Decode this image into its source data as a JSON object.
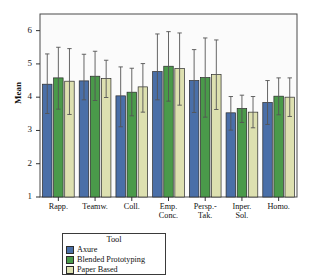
{
  "chart_data": {
    "type": "bar",
    "title": "",
    "xlabel": "Tool",
    "ylabel": "Mean",
    "ylim": [
      1,
      6.5
    ],
    "yticks": [
      1,
      2,
      3,
      4,
      5,
      6
    ],
    "ytick_labels": [
      "1",
      "2",
      "3",
      "4",
      "5",
      "6"
    ],
    "grid": false,
    "legend_position": "below-plot-left",
    "legend_title": "Tool",
    "error_bars": "95% CI",
    "categories": [
      "Rapp.",
      "Teamw.",
      "Coll.",
      "Emp.\nConc.",
      "Persp.-\nTak.",
      "Inper.\nSol.",
      "Homo."
    ],
    "series": [
      {
        "name": "Axure",
        "color": "#4a6fa8",
        "values": [
          4.39,
          4.49,
          4.04,
          4.77,
          4.5,
          3.53,
          3.84
        ],
        "err_low": [
          3.51,
          3.92,
          3.11,
          3.92,
          3.54,
          3.01,
          3.18
        ],
        "err_high": [
          5.3,
          5.29,
          4.91,
          5.9,
          5.43,
          4.02,
          4.5
        ]
      },
      {
        "name": "Blended Prototyping",
        "color": "#4a9a4a",
        "values": [
          4.58,
          4.63,
          4.15,
          4.93,
          4.59,
          3.66,
          4.03
        ],
        "err_low": [
          3.64,
          3.9,
          3.44,
          3.88,
          3.4,
          3.24,
          3.47
        ],
        "err_high": [
          5.5,
          5.38,
          4.87,
          5.97,
          5.78,
          4.06,
          4.58
        ]
      },
      {
        "name": "Paper Based",
        "color": "#dde0b0",
        "values": [
          4.48,
          4.56,
          4.31,
          4.86,
          4.68,
          3.55,
          4.0
        ],
        "err_low": [
          3.48,
          3.99,
          3.55,
          3.76,
          3.63,
          3.08,
          3.42
        ],
        "err_high": [
          5.46,
          5.11,
          5.01,
          5.93,
          5.72,
          4.02,
          4.58
        ]
      }
    ]
  },
  "legend": {
    "title": "Tool",
    "items": [
      {
        "label": "Axure",
        "color": "#4a6fa8"
      },
      {
        "label": "Blended Prototyping",
        "color": "#4a9a4a"
      },
      {
        "label": "Paper Based",
        "color": "#dde0b0"
      }
    ]
  },
  "axes": {
    "y_title": "Mean",
    "x_title": "Tool"
  }
}
